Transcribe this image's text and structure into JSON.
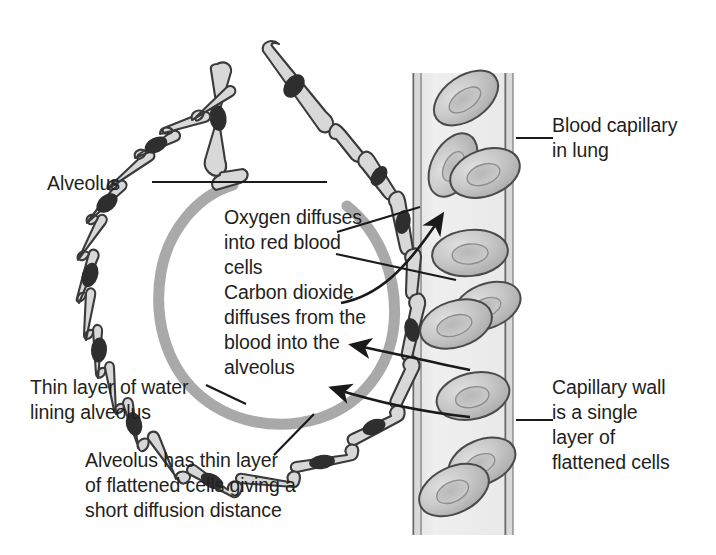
{
  "diagram": {
    "colors": {
      "ink": "#231f20",
      "cell_fill": "#d8d8d8",
      "cell_stroke": "#3a3a3a",
      "nucleus": "#2e2e2e",
      "water_layer": "#a9a9a9",
      "capillary_lumen": "#ececec",
      "capillary_wall_stroke": "#6a6a6a",
      "rbc_fill": "#c9c9c9",
      "rbc_stroke": "#4a4a4a",
      "rbc_dimple": "#b4b4b4",
      "background": "#ffffff"
    }
  },
  "labels": {
    "alveolus": "Alveolus",
    "blood_capillary": "Blood capillary\nin lung",
    "oxygen_diffuses": "Oxygen diffuses\ninto red blood\ncells",
    "carbon_dioxide": "Carbon dioxide\ndiffuses from the\nblood into the\nalveolus",
    "thin_layer_water": "Thin layer of water\nlining alveolus",
    "capillary_wall": "Capillary wall\nis a single\nlayer of\nflattened cells",
    "alveolus_thin_layer": "Alveolus has thin layer\nof flattened cells giving a\nshort diffusion distance"
  },
  "structures": {
    "alveolus_wall_cell_count": 14,
    "red_blood_cell_count": 9,
    "capillary": {
      "orientation": "vertical",
      "wall_description": "single layer of flattened cells drawn as double line"
    }
  },
  "leaders": {
    "alveolus_leader": "horizontal line from Alveolus label to alveolar wall",
    "oxygen_arrow": "curved arrow from text to red blood cell in capillary",
    "carbon_dioxide_arrow": "arrow from capillary into alveolus",
    "water_leader": "short line to inner water layer of alveolar wall",
    "capillary_wall_leader": "horizontal line to capillary wall",
    "thin_layer_leader": "diagonal line to alveolar wall cell"
  }
}
